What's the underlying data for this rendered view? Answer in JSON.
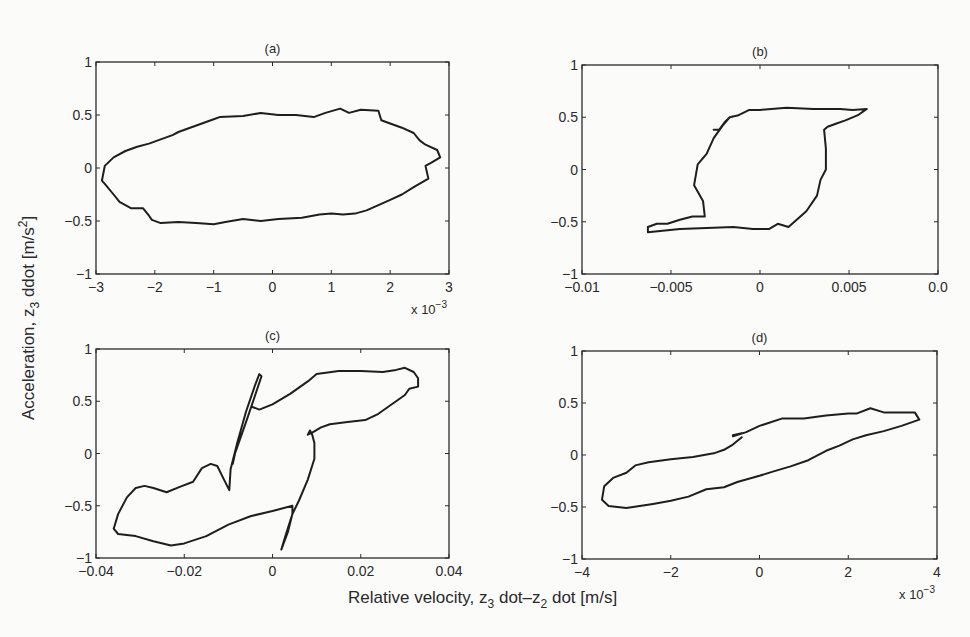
{
  "figure": {
    "ylabel": "Acceleration, z3 ddot [m/s2]",
    "ylabel_parts": {
      "main": "Acceleration, z",
      "sub": "3",
      "mid": " ddot [m/s",
      "sup": "2",
      "end": "]"
    },
    "xlabel": "Relative velocity, z3 dot–z2 dot [m/s]",
    "xlabel_parts": {
      "main": "Relative velocity, z",
      "sub1": "3",
      "mid": " dot–z",
      "sub2": "2",
      "end": " dot [m/s]"
    },
    "line_color": "#1e1e1e",
    "background": "#fbfbfa"
  },
  "chart_data": [
    {
      "id": "a",
      "type": "line",
      "title": "(a)",
      "xlabel": "",
      "ylabel": "",
      "xlim": [
        -0.003,
        0.003
      ],
      "ylim": [
        -1,
        1
      ],
      "x_ticks": [
        -0.003,
        -0.002,
        -0.001,
        0,
        0.001,
        0.002,
        0.003
      ],
      "x_tick_labels": [
        "−3",
        "−2",
        "−1",
        "0",
        "1",
        "2",
        "3"
      ],
      "x_multiplier": "x 10−3",
      "y_ticks": [
        -1,
        -0.5,
        0,
        0.5,
        1
      ],
      "y_tick_labels": [
        "−1",
        "−0.5",
        "0",
        "0.5",
        "1"
      ],
      "grid": false,
      "box": {
        "left": 96,
        "top": 62,
        "right": 449,
        "bottom": 274
      },
      "series": [
        {
          "name": "hysteresis loop a",
          "points": [
            [
              -0.00285,
              0.02
            ],
            [
              -0.0027,
              0.1
            ],
            [
              -0.0025,
              0.16
            ],
            [
              -0.0023,
              0.2
            ],
            [
              -0.0021,
              0.23
            ],
            [
              -0.0019,
              0.27
            ],
            [
              -0.0017,
              0.31
            ],
            [
              -0.0016,
              0.34
            ],
            [
              -0.0014,
              0.38
            ],
            [
              -0.0012,
              0.42
            ],
            [
              -0.001,
              0.46
            ],
            [
              -0.0009,
              0.48
            ],
            [
              -0.0005,
              0.49
            ],
            [
              -0.0002,
              0.52
            ],
            [
              0.0001,
              0.5
            ],
            [
              0.0004,
              0.5
            ],
            [
              0.0007,
              0.48
            ],
            [
              0.0009,
              0.52
            ],
            [
              0.00115,
              0.56
            ],
            [
              0.0013,
              0.52
            ],
            [
              0.0015,
              0.55
            ],
            [
              0.0018,
              0.54
            ],
            [
              0.00185,
              0.45
            ],
            [
              0.002,
              0.42
            ],
            [
              0.0022,
              0.38
            ],
            [
              0.0024,
              0.33
            ],
            [
              0.0025,
              0.26
            ],
            [
              0.0026,
              0.22
            ],
            [
              0.0028,
              0.17
            ],
            [
              0.00285,
              0.1
            ],
            [
              0.0027,
              0.05
            ],
            [
              0.0026,
              0.02
            ],
            [
              0.00265,
              -0.1
            ],
            [
              0.0024,
              -0.18
            ],
            [
              0.0022,
              -0.25
            ],
            [
              0.002,
              -0.3
            ],
            [
              0.0018,
              -0.35
            ],
            [
              0.0016,
              -0.4
            ],
            [
              0.0014,
              -0.43
            ],
            [
              0.0012,
              -0.44
            ],
            [
              0.001,
              -0.43
            ],
            [
              0.0008,
              -0.44
            ],
            [
              0.0005,
              -0.47
            ],
            [
              0.0001,
              -0.48
            ],
            [
              -0.0002,
              -0.5
            ],
            [
              -0.0005,
              -0.48
            ],
            [
              -0.0008,
              -0.51
            ],
            [
              -0.001,
              -0.53
            ],
            [
              -0.0013,
              -0.52
            ],
            [
              -0.0016,
              -0.51
            ],
            [
              -0.0019,
              -0.52
            ],
            [
              -0.00205,
              -0.49
            ],
            [
              -0.0021,
              -0.45
            ],
            [
              -0.0022,
              -0.38
            ],
            [
              -0.0024,
              -0.38
            ],
            [
              -0.0026,
              -0.32
            ],
            [
              -0.0027,
              -0.25
            ],
            [
              -0.00285,
              -0.15
            ],
            [
              -0.0029,
              -0.12
            ],
            [
              -0.00285,
              0.02
            ]
          ]
        }
      ]
    },
    {
      "id": "b",
      "type": "line",
      "title": "(b)",
      "xlabel": "",
      "ylabel": "",
      "xlim": [
        -0.01,
        0.01
      ],
      "ylim": [
        -1,
        1
      ],
      "x_ticks": [
        -0.01,
        -0.005,
        0,
        0.005,
        0.01
      ],
      "x_tick_labels": [
        "−0.01",
        "−0.005",
        "0",
        "0.005",
        "0.0"
      ],
      "y_ticks": [
        -1,
        -0.5,
        0,
        0.5,
        1
      ],
      "y_tick_labels": [
        "−1",
        "−0.5",
        "0",
        "0.5",
        "1"
      ],
      "grid": false,
      "box": {
        "left": 582,
        "top": 65,
        "right": 938,
        "bottom": 274
      },
      "series": [
        {
          "name": "hysteresis loop b",
          "points": [
            [
              -0.0026,
              0.38
            ],
            [
              -0.0023,
              0.38
            ],
            [
              -0.002,
              0.45
            ],
            [
              -0.0017,
              0.5
            ],
            [
              -0.0012,
              0.52
            ],
            [
              -0.0006,
              0.57
            ],
            [
              0.0,
              0.57
            ],
            [
              0.0015,
              0.59
            ],
            [
              0.003,
              0.58
            ],
            [
              0.0045,
              0.58
            ],
            [
              0.0052,
              0.57
            ],
            [
              0.006,
              0.58
            ],
            [
              0.0055,
              0.52
            ],
            [
              0.0048,
              0.47
            ],
            [
              0.0043,
              0.44
            ],
            [
              0.0038,
              0.41
            ],
            [
              0.0036,
              0.38
            ],
            [
              0.0037,
              0.2
            ],
            [
              0.0037,
              0.0
            ],
            [
              0.0034,
              -0.1
            ],
            [
              0.0032,
              -0.25
            ],
            [
              0.0026,
              -0.4
            ],
            [
              0.0016,
              -0.55
            ],
            [
              0.001,
              -0.52
            ],
            [
              0.0005,
              -0.57
            ],
            [
              -0.0004,
              -0.57
            ],
            [
              -0.0015,
              -0.55
            ],
            [
              -0.003,
              -0.56
            ],
            [
              -0.0045,
              -0.57
            ],
            [
              -0.0063,
              -0.6
            ],
            [
              -0.0063,
              -0.55
            ],
            [
              -0.0058,
              -0.52
            ],
            [
              -0.0052,
              -0.52
            ],
            [
              -0.0045,
              -0.48
            ],
            [
              -0.0038,
              -0.45
            ],
            [
              -0.0031,
              -0.45
            ],
            [
              -0.0032,
              -0.3
            ],
            [
              -0.0037,
              -0.15
            ],
            [
              -0.0035,
              0.05
            ],
            [
              -0.003,
              0.15
            ],
            [
              -0.0026,
              0.3
            ],
            [
              -0.0021,
              0.42
            ],
            [
              -0.0017,
              0.5
            ]
          ]
        }
      ]
    },
    {
      "id": "c",
      "type": "line",
      "title": "(c)",
      "xlabel": "",
      "ylabel": "",
      "xlim": [
        -0.04,
        0.04
      ],
      "ylim": [
        -1,
        1
      ],
      "x_ticks": [
        -0.04,
        -0.02,
        0,
        0.02,
        0.04
      ],
      "x_tick_labels": [
        "−0.04",
        "−0.02",
        "0",
        "0.02",
        "0.04"
      ],
      "y_ticks": [
        -1,
        -0.5,
        0,
        0.5,
        1
      ],
      "y_tick_labels": [
        "−1",
        "−0.5",
        "0",
        "0.5",
        "1"
      ],
      "grid": false,
      "box": {
        "left": 96,
        "top": 349,
        "right": 449,
        "bottom": 558
      },
      "series": [
        {
          "name": "hysteresis loop c",
          "points": [
            [
              -0.0048,
              0.45
            ],
            [
              -0.003,
              0.42
            ],
            [
              0.0,
              0.47
            ],
            [
              0.004,
              0.57
            ],
            [
              0.008,
              0.69
            ],
            [
              0.01,
              0.76
            ],
            [
              0.015,
              0.79
            ],
            [
              0.02,
              0.79
            ],
            [
              0.025,
              0.78
            ],
            [
              0.028,
              0.8
            ],
            [
              0.03,
              0.82
            ],
            [
              0.032,
              0.78
            ],
            [
              0.033,
              0.72
            ],
            [
              0.033,
              0.64
            ],
            [
              0.031,
              0.62
            ],
            [
              0.03,
              0.56
            ],
            [
              0.028,
              0.5
            ],
            [
              0.026,
              0.44
            ],
            [
              0.024,
              0.38
            ],
            [
              0.021,
              0.32
            ],
            [
              0.017,
              0.3
            ],
            [
              0.013,
              0.28
            ],
            [
              0.011,
              0.25
            ],
            [
              0.009,
              0.2
            ],
            [
              0.008,
              0.18
            ],
            [
              0.0085,
              0.22
            ],
            [
              0.009,
              0.18
            ],
            [
              0.0095,
              0.1
            ],
            [
              0.0095,
              -0.05
            ],
            [
              0.008,
              -0.25
            ],
            [
              0.006,
              -0.45
            ],
            [
              0.0045,
              -0.58
            ],
            [
              0.003,
              -0.78
            ],
            [
              0.002,
              -0.92
            ],
            [
              0.0035,
              -0.75
            ],
            [
              0.0045,
              -0.58
            ],
            [
              0.0045,
              -0.5
            ],
            [
              0.0,
              -0.55
            ],
            [
              -0.005,
              -0.6
            ],
            [
              -0.01,
              -0.68
            ],
            [
              -0.015,
              -0.79
            ],
            [
              -0.02,
              -0.86
            ],
            [
              -0.023,
              -0.88
            ],
            [
              -0.027,
              -0.84
            ],
            [
              -0.031,
              -0.79
            ],
            [
              -0.035,
              -0.77
            ],
            [
              -0.036,
              -0.72
            ],
            [
              -0.035,
              -0.58
            ],
            [
              -0.033,
              -0.42
            ],
            [
              -0.031,
              -0.33
            ],
            [
              -0.029,
              -0.31
            ],
            [
              -0.027,
              -0.33
            ],
            [
              -0.024,
              -0.37
            ],
            [
              -0.021,
              -0.32
            ],
            [
              -0.018,
              -0.27
            ],
            [
              -0.016,
              -0.14
            ],
            [
              -0.014,
              -0.1
            ],
            [
              -0.0125,
              -0.12
            ],
            [
              -0.011,
              -0.25
            ],
            [
              -0.0098,
              -0.35
            ],
            [
              -0.0095,
              -0.15
            ],
            [
              -0.008,
              0.1
            ],
            [
              -0.006,
              0.4
            ],
            [
              -0.004,
              0.65
            ],
            [
              -0.003,
              0.76
            ],
            [
              -0.0025,
              0.74
            ],
            [
              -0.004,
              0.55
            ],
            [
              -0.006,
              0.3
            ],
            [
              -0.0085,
              0.0
            ],
            [
              -0.009,
              -0.1
            ]
          ]
        }
      ]
    },
    {
      "id": "d",
      "type": "line",
      "title": "(d)",
      "xlabel": "",
      "ylabel": "",
      "xlim": [
        -0.004,
        0.004
      ],
      "ylim": [
        -1,
        1
      ],
      "x_ticks": [
        -0.004,
        -0.002,
        0,
        0.002,
        0.004
      ],
      "x_tick_labels": [
        "−4",
        "−2",
        "0",
        "2",
        "4"
      ],
      "x_multiplier": "x 10−3",
      "y_ticks": [
        -1,
        -0.5,
        0,
        0.5,
        1
      ],
      "y_tick_labels": [
        "−1",
        "−0.5",
        "0",
        "0.5",
        "1"
      ],
      "grid": false,
      "box": {
        "left": 582,
        "top": 351,
        "right": 937,
        "bottom": 559
      },
      "series": [
        {
          "name": "hysteresis loop d",
          "points": [
            [
              -0.0006,
              0.19
            ],
            [
              -0.0004,
              0.21
            ],
            [
              -0.0006,
              0.18
            ],
            [
              -0.0003,
              0.22
            ],
            [
              0.0,
              0.28
            ],
            [
              0.0005,
              0.35
            ],
            [
              0.001,
              0.35
            ],
            [
              0.0015,
              0.38
            ],
            [
              0.002,
              0.4
            ],
            [
              0.0022,
              0.4
            ],
            [
              0.0025,
              0.45
            ],
            [
              0.0028,
              0.41
            ],
            [
              0.0032,
              0.41
            ],
            [
              0.0035,
              0.41
            ],
            [
              0.0036,
              0.34
            ],
            [
              0.0032,
              0.28
            ],
            [
              0.0028,
              0.23
            ],
            [
              0.0024,
              0.19
            ],
            [
              0.0021,
              0.15
            ],
            [
              0.0018,
              0.09
            ],
            [
              0.0015,
              0.04
            ],
            [
              0.0011,
              -0.05
            ],
            [
              0.0007,
              -0.11
            ],
            [
              0.0003,
              -0.16
            ],
            [
              0.0,
              -0.2
            ],
            [
              -0.0005,
              -0.26
            ],
            [
              -0.0008,
              -0.31
            ],
            [
              -0.0012,
              -0.33
            ],
            [
              -0.0016,
              -0.4
            ],
            [
              -0.002,
              -0.44
            ],
            [
              -0.0024,
              -0.47
            ],
            [
              -0.003,
              -0.51
            ],
            [
              -0.0034,
              -0.49
            ],
            [
              -0.00355,
              -0.43
            ],
            [
              -0.0035,
              -0.3
            ],
            [
              -0.0033,
              -0.22
            ],
            [
              -0.003,
              -0.17
            ],
            [
              -0.0028,
              -0.1
            ],
            [
              -0.0025,
              -0.07
            ],
            [
              -0.002,
              -0.04
            ],
            [
              -0.0015,
              -0.02
            ],
            [
              -0.001,
              0.02
            ],
            [
              -0.0008,
              0.05
            ],
            [
              -0.0006,
              0.1
            ],
            [
              -0.0004,
              0.17
            ]
          ]
        }
      ]
    }
  ]
}
